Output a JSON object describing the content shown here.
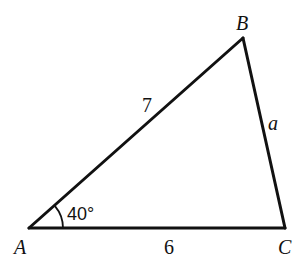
{
  "diagram": {
    "type": "triangle",
    "vertices": [
      {
        "id": "A",
        "label": "A",
        "x": 29,
        "y": 228
      },
      {
        "id": "B",
        "label": "B",
        "x": 243,
        "y": 38
      },
      {
        "id": "C",
        "label": "C",
        "x": 285,
        "y": 228
      }
    ],
    "sides": [
      {
        "from": "A",
        "to": "B",
        "label": "7"
      },
      {
        "from": "B",
        "to": "C",
        "label": "a"
      },
      {
        "from": "A",
        "to": "C",
        "label": "6"
      }
    ],
    "angles": [
      {
        "vertex": "A",
        "label": "40°"
      }
    ],
    "colors": {
      "stroke": "#111111",
      "background": "#ffffff"
    }
  }
}
